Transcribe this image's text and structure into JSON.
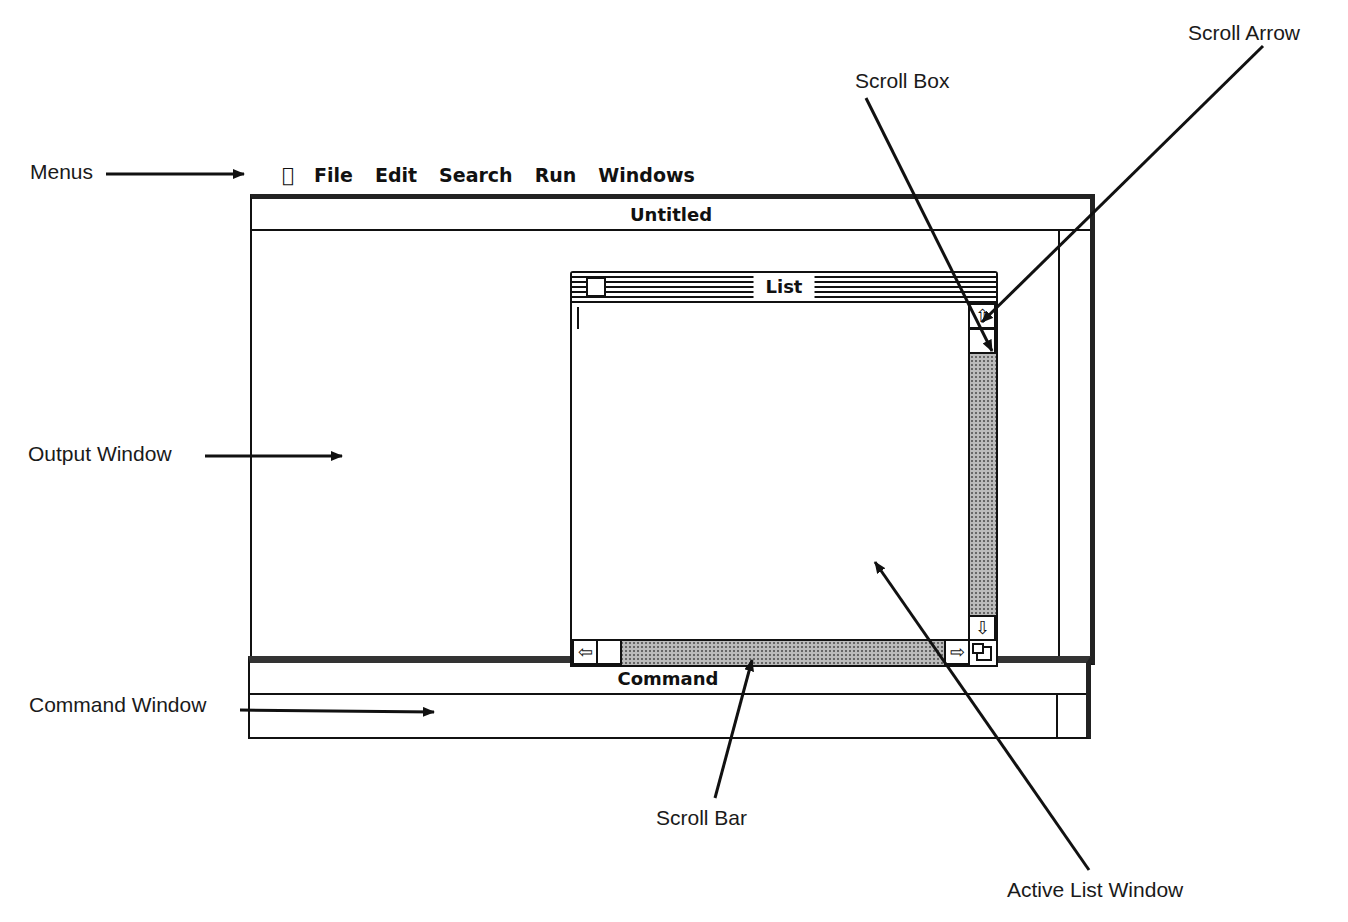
{
  "menubar": {
    "apple": "",
    "items": [
      "File",
      "Edit",
      "Search",
      "Run",
      "Windows"
    ]
  },
  "windows": {
    "output": {
      "title": "Untitled"
    },
    "list": {
      "title": "List"
    },
    "command": {
      "title": "Command"
    }
  },
  "callouts": {
    "menus": "Menus",
    "output_window": "Output Window",
    "command_window": "Command Window",
    "scroll_box": "Scroll Box",
    "scroll_arrow": "Scroll Arrow",
    "scroll_bar": "Scroll Bar",
    "active_list_window": "Active List Window"
  },
  "icons": {
    "scroll_up": "⇧",
    "scroll_down": "⇩",
    "scroll_left": "⇦",
    "scroll_right": "⇨"
  }
}
